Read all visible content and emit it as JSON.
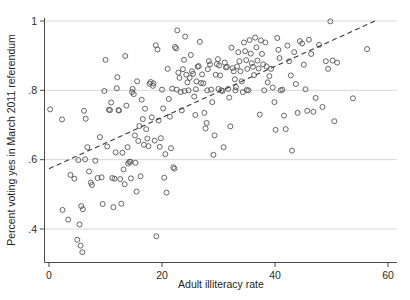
{
  "chart_data": {
    "type": "scatter",
    "title": "",
    "xlabel": "Adult illiteracy rate",
    "ylabel": "Percent voting yes in March 2011 referendum",
    "xlim": [
      -1.5,
      62
    ],
    "ylim": [
      0.318,
      1.035
    ],
    "xticks": [
      0,
      20,
      40,
      60
    ],
    "xtick_labels": [
      "0",
      "20",
      "40",
      "60"
    ],
    "yticks": [
      0.4,
      0.6,
      0.8,
      1.0
    ],
    "ytick_labels": [
      ".4",
      ".6",
      ".8",
      "1"
    ],
    "grid": "horizontal",
    "legend": "none",
    "marker": "open-circle",
    "marker_color": "#555555",
    "fit_line": {
      "style": "dashed",
      "color": "#3a3a3a",
      "x_start": 0.0,
      "y_start": 0.574,
      "x_end": 57.7,
      "y_end": 1.0
    },
    "points": [
      [
        0.2,
        0.745
      ],
      [
        2.3,
        0.716
      ],
      [
        2.4,
        0.455
      ],
      [
        3.4,
        0.427
      ],
      [
        3.8,
        0.556
      ],
      [
        4.5,
        0.545
      ],
      [
        5.0,
        0.369
      ],
      [
        5.2,
        0.599
      ],
      [
        5.4,
        0.413
      ],
      [
        5.6,
        0.352
      ],
      [
        5.7,
        0.466
      ],
      [
        5.9,
        0.333
      ],
      [
        6.0,
        0.457
      ],
      [
        6.2,
        0.741
      ],
      [
        6.4,
        0.601
      ],
      [
        6.5,
        0.718
      ],
      [
        6.8,
        0.636
      ],
      [
        7.1,
        0.566
      ],
      [
        7.4,
        0.534
      ],
      [
        7.6,
        0.527
      ],
      [
        8.2,
        0.597
      ],
      [
        8.6,
        0.547
      ],
      [
        9.0,
        0.665
      ],
      [
        9.3,
        0.549
      ],
      [
        9.5,
        0.472
      ],
      [
        9.8,
        0.798
      ],
      [
        10.0,
        0.888
      ],
      [
        10.3,
        0.638
      ],
      [
        10.6,
        0.744
      ],
      [
        10.8,
        0.743
      ],
      [
        11.0,
        0.765
      ],
      [
        11.2,
        0.547
      ],
      [
        11.4,
        0.463
      ],
      [
        11.6,
        0.545
      ],
      [
        11.8,
        0.621
      ],
      [
        12.0,
        0.806
      ],
      [
        12.1,
        0.838
      ],
      [
        12.3,
        0.743
      ],
      [
        12.4,
        0.742
      ],
      [
        12.6,
        0.544
      ],
      [
        12.8,
        0.473
      ],
      [
        13.0,
        0.62
      ],
      [
        13.2,
        0.572
      ],
      [
        13.4,
        0.529
      ],
      [
        13.5,
        0.899
      ],
      [
        13.7,
        0.756
      ],
      [
        13.9,
        0.636
      ],
      [
        14.0,
        0.589
      ],
      [
        14.2,
        0.594
      ],
      [
        14.4,
        0.594
      ],
      [
        14.5,
        0.546
      ],
      [
        14.7,
        0.795
      ],
      [
        14.8,
        0.804
      ],
      [
        15.0,
        0.789
      ],
      [
        15.2,
        0.67
      ],
      [
        15.3,
        0.591
      ],
      [
        15.5,
        0.508
      ],
      [
        15.6,
        0.826
      ],
      [
        15.8,
        0.654
      ],
      [
        16.0,
        0.697
      ],
      [
        16.2,
        0.552
      ],
      [
        16.4,
        0.773
      ],
      [
        16.6,
        0.717
      ],
      [
        16.8,
        0.643
      ],
      [
        17.0,
        0.747
      ],
      [
        17.2,
        0.688
      ],
      [
        17.4,
        0.661
      ],
      [
        17.6,
        0.639
      ],
      [
        17.8,
        0.819
      ],
      [
        18.0,
        0.824
      ],
      [
        18.2,
        0.722
      ],
      [
        18.4,
        0.813
      ],
      [
        18.5,
        0.82
      ],
      [
        18.7,
        0.655
      ],
      [
        18.9,
        0.93
      ],
      [
        19.0,
        0.379
      ],
      [
        19.2,
        0.918
      ],
      [
        19.4,
        0.713
      ],
      [
        19.6,
        0.637
      ],
      [
        19.8,
        0.662
      ],
      [
        20.0,
        0.802
      ],
      [
        20.2,
        0.748
      ],
      [
        20.4,
        0.548
      ],
      [
        20.6,
        0.616
      ],
      [
        20.8,
        0.505
      ],
      [
        21.0,
        0.862
      ],
      [
        21.2,
        0.775
      ],
      [
        21.4,
        0.724
      ],
      [
        21.6,
        0.633
      ],
      [
        21.8,
        0.805
      ],
      [
        22.0,
        0.578
      ],
      [
        22.2,
        0.574
      ],
      [
        22.3,
        0.925
      ],
      [
        22.5,
        0.921
      ],
      [
        22.7,
        0.973
      ],
      [
        22.9,
        0.851
      ],
      [
        23.1,
        0.836
      ],
      [
        23.3,
        0.795
      ],
      [
        23.5,
        0.742
      ],
      [
        23.7,
        0.861
      ],
      [
        23.9,
        0.888
      ],
      [
        24.1,
        0.955
      ],
      [
        24.3,
        0.845
      ],
      [
        24.5,
        0.823
      ],
      [
        24.7,
        0.8
      ],
      [
        24.9,
        0.836
      ],
      [
        25.1,
        0.902
      ],
      [
        25.3,
        0.855
      ],
      [
        25.5,
        0.848
      ],
      [
        25.7,
        0.782
      ],
      [
        25.9,
        0.729
      ],
      [
        26.1,
        0.826
      ],
      [
        26.3,
        0.868
      ],
      [
        26.5,
        0.87
      ],
      [
        26.7,
        0.94
      ],
      [
        26.9,
        0.821
      ],
      [
        27.1,
        0.846
      ],
      [
        27.3,
        0.82
      ],
      [
        27.5,
        0.735
      ],
      [
        27.7,
        0.69
      ],
      [
        27.9,
        0.706
      ],
      [
        28.1,
        0.861
      ],
      [
        28.3,
        0.884
      ],
      [
        28.5,
        0.875
      ],
      [
        28.7,
        0.802
      ],
      [
        28.9,
        0.766
      ],
      [
        29.1,
        0.614
      ],
      [
        29.3,
        0.67
      ],
      [
        29.5,
        0.845
      ],
      [
        29.7,
        0.876
      ],
      [
        29.9,
        0.89
      ],
      [
        30.1,
        0.872
      ],
      [
        30.3,
        0.843
      ],
      [
        30.5,
        0.8
      ],
      [
        30.7,
        0.798
      ],
      [
        30.9,
        0.636
      ],
      [
        31.1,
        0.88
      ],
      [
        31.3,
        0.866
      ],
      [
        31.5,
        0.868
      ],
      [
        31.7,
        0.804
      ],
      [
        31.9,
        0.779
      ],
      [
        32.1,
        0.696
      ],
      [
        32.3,
        0.923
      ],
      [
        32.5,
        0.864
      ],
      [
        32.7,
        0.855
      ],
      [
        32.9,
        0.832
      ],
      [
        33.1,
        0.809
      ],
      [
        33.3,
        0.869
      ],
      [
        33.5,
        0.91
      ],
      [
        33.7,
        0.884
      ],
      [
        33.9,
        0.855
      ],
      [
        34.1,
        0.826
      ],
      [
        34.3,
        0.795
      ],
      [
        34.5,
        0.938
      ],
      [
        34.7,
        0.913
      ],
      [
        34.9,
        0.887
      ],
      [
        35.1,
        0.862
      ],
      [
        35.3,
        0.8
      ],
      [
        35.5,
        0.945
      ],
      [
        35.7,
        0.906
      ],
      [
        35.9,
        0.878
      ],
      [
        36.1,
        0.868
      ],
      [
        36.3,
        0.844
      ],
      [
        36.5,
        0.952
      ],
      [
        36.7,
        0.924
      ],
      [
        36.9,
        0.886
      ],
      [
        37.1,
        0.863
      ],
      [
        37.3,
        0.73
      ],
      [
        37.5,
        0.944
      ],
      [
        37.7,
        0.905
      ],
      [
        37.9,
        0.875
      ],
      [
        38.1,
        0.8
      ],
      [
        38.3,
        0.938
      ],
      [
        38.5,
        0.869
      ],
      [
        38.7,
        0.823
      ],
      [
        39.0,
        0.841
      ],
      [
        39.3,
        0.862
      ],
      [
        39.6,
        0.808
      ],
      [
        39.9,
        0.766
      ],
      [
        40.1,
        0.686
      ],
      [
        40.4,
        0.951
      ],
      [
        40.6,
        0.917
      ],
      [
        40.8,
        0.893
      ],
      [
        41.0,
        0.8
      ],
      [
        41.3,
        0.802
      ],
      [
        41.6,
        0.727
      ],
      [
        41.9,
        0.688
      ],
      [
        42.2,
        0.929
      ],
      [
        42.5,
        0.884
      ],
      [
        42.8,
        0.843
      ],
      [
        43.0,
        0.626
      ],
      [
        43.4,
        0.91
      ],
      [
        43.7,
        0.818
      ],
      [
        44.0,
        0.735
      ],
      [
        44.4,
        0.942
      ],
      [
        44.8,
        0.935
      ],
      [
        45.1,
        0.874
      ],
      [
        45.4,
        0.803
      ],
      [
        45.7,
        0.741
      ],
      [
        46.0,
        0.946
      ],
      [
        46.4,
        0.905
      ],
      [
        46.8,
        0.738
      ],
      [
        47.2,
        0.778
      ],
      [
        47.8,
        0.931
      ],
      [
        48.4,
        0.752
      ],
      [
        49.0,
        0.884
      ],
      [
        49.4,
        0.862
      ],
      [
        49.8,
        0.999
      ],
      [
        50.2,
        0.886
      ],
      [
        50.5,
        0.711
      ],
      [
        51.0,
        0.88
      ],
      [
        53.8,
        0.777
      ],
      [
        56.3,
        0.919
      ],
      [
        30.0,
        0.804
      ],
      [
        28.0,
        0.8
      ],
      [
        26.0,
        0.803
      ],
      [
        24.0,
        0.798
      ],
      [
        22.6,
        0.802
      ],
      [
        33.0,
        0.8
      ],
      [
        35.0,
        0.801
      ]
    ]
  }
}
